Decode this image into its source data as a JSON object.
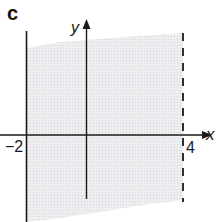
{
  "figure": {
    "part_label": "c",
    "axes": {
      "x_label": "x",
      "y_label": "y"
    },
    "boundaries": [
      {
        "name": "left-boundary",
        "value_label": "−2",
        "x": -2,
        "style": "solid",
        "inclusive": true
      },
      {
        "name": "right-boundary",
        "value_label": "4",
        "x": 4,
        "style": "dashed",
        "inclusive": false
      }
    ],
    "region": {
      "description": "-2 ≤ x < 4",
      "fill_color": "#e6e9ec",
      "grid_color": "#d6dade"
    },
    "colors": {
      "axis": "#1a1a1a",
      "line": "#1a1a1a",
      "background": "#ffffff"
    }
  }
}
